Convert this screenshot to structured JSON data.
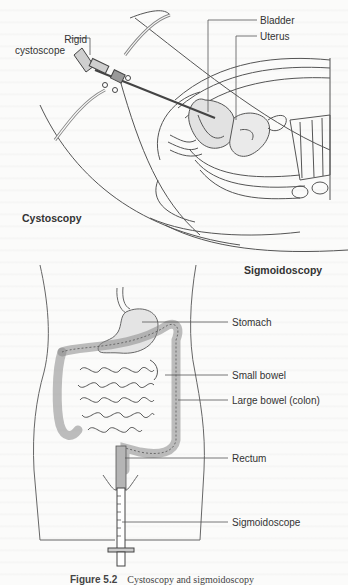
{
  "figure": {
    "panels": [
      {
        "title": "Cystoscopy",
        "labels": {
          "instrument": "Rigid cystoscope",
          "instrument_line1": "Rigid",
          "instrument_line2": "cystoscope",
          "bladder": "Bladder",
          "uterus": "Uterus"
        }
      },
      {
        "title": "Sigmoidoscopy",
        "labels": {
          "stomach": "Stomach",
          "small_bowel": "Small bowel",
          "large_bowel": "Large bowel (colon)",
          "rectum": "Rectum",
          "sigmoidoscope": "Sigmoidoscope"
        }
      }
    ],
    "caption": {
      "number": "Figure 5.2",
      "text": "Cystoscopy and sigmoidoscopy"
    },
    "colors": {
      "line": "#555555",
      "organ_fill": "#dcdcdc",
      "organ_fill_dark": "#a8a8a8",
      "paper": "#fbfbfa"
    }
  }
}
